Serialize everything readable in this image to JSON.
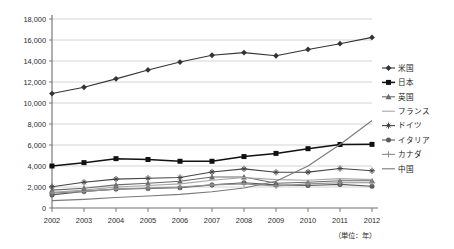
{
  "chart_data": {
    "type": "line",
    "title": "",
    "subtitle": "",
    "xlabel": "（単位：年）",
    "ylabel": "",
    "x": [
      2002,
      2003,
      2004,
      2005,
      2006,
      2007,
      2008,
      2009,
      2010,
      2011,
      2012
    ],
    "categories": [
      "2002",
      "2003",
      "2004",
      "2005",
      "2006",
      "2007",
      "2008",
      "2009",
      "2010",
      "2011",
      "2012"
    ],
    "xlim": [
      2002,
      2012
    ],
    "ylim": [
      0,
      18000
    ],
    "ytick_values": [
      0,
      2000,
      4000,
      6000,
      8000,
      10000,
      12000,
      14000,
      16000,
      18000
    ],
    "ytick_labels": [
      "0",
      "2,000",
      "4,000",
      "6,000",
      "8,000",
      "10,000",
      "12,000",
      "14,000",
      "16,000",
      "18,000"
    ],
    "grid": true,
    "grid_axis": "y",
    "legend_position": "right",
    "series": [
      {
        "name": "米国",
        "marker": "diamond",
        "color": "#333333",
        "values": [
          10900,
          11500,
          12300,
          13150,
          13900,
          14550,
          14800,
          14500,
          15100,
          15650,
          16250
        ]
      },
      {
        "name": "日本",
        "marker": "square",
        "color": "#111111",
        "values": [
          4000,
          4320,
          4700,
          4620,
          4450,
          4450,
          4900,
          5200,
          5650,
          6050,
          6060
        ]
      },
      {
        "name": "英国",
        "marker": "triangle",
        "color": "#6b6b6b",
        "values": [
          1700,
          1880,
          2200,
          2350,
          2550,
          2950,
          2950,
          2350,
          2450,
          2600,
          2600
        ]
      },
      {
        "name": "フランス",
        "marker": "line",
        "color": "#a6a6a6",
        "values": [
          1500,
          1700,
          2000,
          2150,
          2300,
          2650,
          2900,
          2700,
          2650,
          2800,
          2700
        ]
      },
      {
        "name": "ドイツ",
        "marker": "asterisk",
        "color": "#444444",
        "values": [
          2020,
          2450,
          2750,
          2830,
          2900,
          3430,
          3730,
          3400,
          3420,
          3760,
          3550
        ]
      },
      {
        "name": "イタリア",
        "marker": "circle",
        "color": "#5a5a5a",
        "values": [
          1250,
          1580,
          1800,
          1850,
          1930,
          2200,
          2400,
          2200,
          2150,
          2250,
          2070
        ]
      },
      {
        "name": "カナダ",
        "marker": "plus",
        "color": "#909090",
        "values": [
          1420,
          1580,
          1800,
          1900,
          2000,
          2200,
          2300,
          2100,
          2300,
          2400,
          2400
        ]
      },
      {
        "name": "中国",
        "marker": "line",
        "color": "#7a7a7a",
        "values": [
          700,
          820,
          1000,
          1150,
          1300,
          1550,
          1900,
          2550,
          4000,
          6050,
          8330
        ]
      }
    ]
  },
  "legend": {
    "items": [
      {
        "label": "米国"
      },
      {
        "label": "日本"
      },
      {
        "label": "英国"
      },
      {
        "label": "フランス"
      },
      {
        "label": "ドイツ"
      },
      {
        "label": "イタリア"
      },
      {
        "label": "カナダ"
      },
      {
        "label": "中国"
      }
    ]
  },
  "colors": {
    "axis": "#6e6e6e",
    "grid": "#c9c9c9",
    "background": "#ffffff",
    "text": "#1a1a1a"
  }
}
